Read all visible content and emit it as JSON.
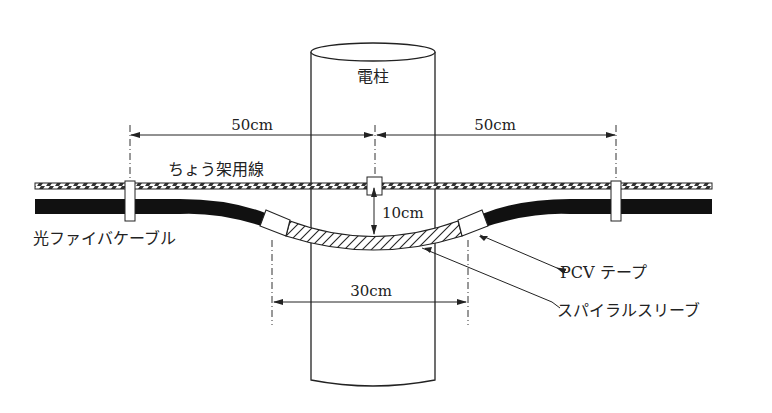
{
  "diagram": {
    "pole_label": "電柱",
    "messenger_wire_label": "ちょう架用線",
    "cable_label": "光ファイバケーブル",
    "tape_label": "PCV テープ",
    "sleeve_label": "スパイラルスリーブ",
    "dimensions": {
      "left_span": "50cm",
      "right_span": "50cm",
      "sag": "10cm",
      "sleeve_span": "30cm"
    },
    "colors": {
      "line": "#222222",
      "cable": "#111111",
      "background": "#ffffff"
    }
  }
}
